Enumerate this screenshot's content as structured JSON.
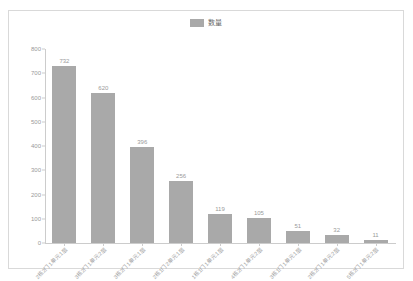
{
  "chart_data": {
    "type": "bar",
    "title": "",
    "xlabel": "",
    "ylabel": "",
    "ylim": [
      0,
      800
    ],
    "grid": false,
    "legend_position": "top-center",
    "legend": [
      "数量"
    ],
    "categories": [
      "2栋2门1单元1层",
      "3栋2门1单元2层",
      "3栋2门1单元1层",
      "2栋1门2单元1层",
      "1栋1门1单元1层",
      "4栋2门1单元2层",
      "3栋1门1单元1层",
      "2栋2门1单元2层",
      "5栋2门1单元2层"
    ],
    "values": [
      732,
      620,
      396,
      256,
      119,
      105,
      51,
      32,
      11
    ],
    "series": [
      {
        "name": "数量",
        "values": [
          732,
          620,
          396,
          256,
          119,
          105,
          51,
          32,
          11
        ],
        "color": "#a9a9a9"
      }
    ],
    "yticks": [
      0,
      100,
      200,
      300,
      400,
      500,
      600,
      700,
      800
    ],
    "ytick_labels": [
      "0",
      "100",
      "200",
      "300",
      "400",
      "500",
      "600",
      "700",
      "800"
    ]
  },
  "legend": {
    "label": "数量",
    "swatch_color": "#a9a9a9"
  },
  "style": {
    "bar_color": "#a9a9a9",
    "axis_color": "#cccccc",
    "label_color": "#999999",
    "frame_color": "#d9d9d9",
    "background": "#ffffff"
  }
}
